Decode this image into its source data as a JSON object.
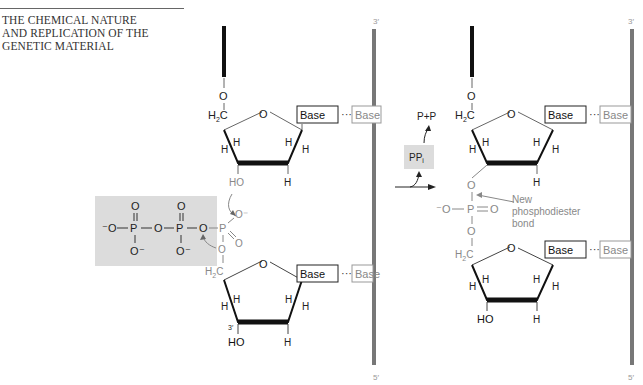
{
  "header": {
    "title_lines": [
      "THE CHEMICAL NATURE",
      "AND REPLICATION OF THE",
      "GENETIC MATERIAL"
    ]
  },
  "diagram": {
    "left": {
      "top_nucleotide": {
        "o5": "O",
        "c5": "H2C",
        "ring_o": "O",
        "base": "Base",
        "pair": "···",
        "partner_base": "Base",
        "h_labels": [
          "H",
          "H",
          "H",
          "H",
          "H"
        ],
        "oh3": "HO"
      },
      "triphosphate": {
        "groups": [
          "⁻O",
          "P",
          "O",
          "P",
          "O",
          "P"
        ],
        "oxygens_top": [
          "O",
          "O"
        ],
        "oxygens_bottom": [
          "O⁻",
          "O⁻"
        ],
        "alpha_o_minus": "O⁻",
        "alpha_double_o": "O",
        "bridge_o": "O"
      },
      "bottom_nucleotide": {
        "c5": "H2C",
        "ring_o": "O",
        "base": "Base",
        "pair": "···",
        "partner_base": "Base",
        "h_labels": [
          "H",
          "H",
          "H",
          "H",
          "H"
        ],
        "oh3": "HO",
        "prime3": "3′"
      },
      "template_strand": {
        "top_label": "3′",
        "bottom_label": "5′"
      }
    },
    "reaction": {
      "byproduct": "PPi",
      "hydrolysis": "P+P"
    },
    "right": {
      "top_nucleotide": {
        "o5": "O",
        "c5": "H2C",
        "ring_o": "O",
        "base": "Base",
        "pair": "···",
        "partner_base": "Base"
      },
      "phosphodiester": {
        "o_minus": "⁻O",
        "p": "P",
        "double_o": "O",
        "o3": "O",
        "o5": "O"
      },
      "annotation": [
        "New",
        "phosphodiester",
        "bond"
      ],
      "bottom_nucleotide": {
        "c5": "H2C",
        "ring_o": "O",
        "base": "Base",
        "pair": "···",
        "partner_base": "Base",
        "oh3": "HO"
      },
      "template_strand": {
        "top_label": "3′",
        "bottom_label": "5′"
      }
    },
    "colors": {
      "strand_dark": "#111111",
      "template_gray": "#777777",
      "light_text": "#888888",
      "shade_box": "#dcdcdc"
    }
  }
}
